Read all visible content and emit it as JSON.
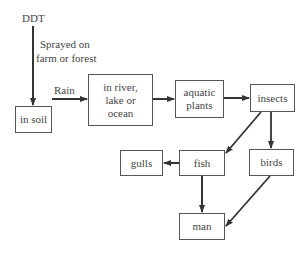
{
  "diagram": {
    "source_label": "DDT",
    "application_label_line1": "Sprayed on",
    "application_label_line2": "farm or forest",
    "rain_label": "Rain",
    "nodes": {
      "soil": "in soil",
      "water_line1": "in river,",
      "water_line2": "lake or",
      "water_line3": "ocean",
      "plants_line1": "aquatic",
      "plants_line2": "plants",
      "insects": "insects",
      "fish": "fish",
      "birds": "birds",
      "gulls": "gulls",
      "man": "man"
    },
    "edges": [
      {
        "from": "DDT",
        "to": "in soil",
        "label": "Sprayed on farm or forest"
      },
      {
        "from": "in soil",
        "to": "in river, lake or ocean",
        "label": "Rain"
      },
      {
        "from": "in river, lake or ocean",
        "to": "aquatic plants"
      },
      {
        "from": "aquatic plants",
        "to": "insects"
      },
      {
        "from": "insects",
        "to": "fish"
      },
      {
        "from": "insects",
        "to": "birds"
      },
      {
        "from": "fish",
        "to": "gulls"
      },
      {
        "from": "fish",
        "to": "man"
      },
      {
        "from": "birds",
        "to": "man"
      }
    ],
    "line_color": "#333333"
  }
}
